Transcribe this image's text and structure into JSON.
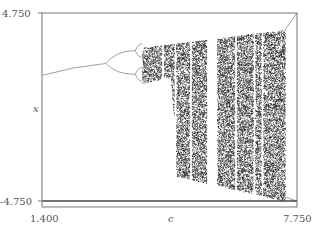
{
  "chart_data": {
    "type": "scatter",
    "title": "",
    "subtitle": "Bifurcation diagram (iterated map x -> x^2 - c style), period-doubling route to chaos",
    "xlabel": "c",
    "ylabel": "x",
    "xlim": [
      1.4,
      7.75
    ],
    "ylim": [
      -4.75,
      4.75
    ],
    "x_ticks": [
      "1.400",
      "7.750"
    ],
    "y_ticks": [
      "4.750",
      "-4.750"
    ],
    "grid": false,
    "legend": null,
    "colors": {
      "points": "#111111",
      "frame": "#777777",
      "curve": "#888888"
    },
    "features": {
      "fixed_point_branch": {
        "c_start": 1.4,
        "x_start": 1.6,
        "c_end": 2.99,
        "x_end": 2.2
      },
      "first_bifurcation_c": 2.99,
      "period2_branches": [
        {
          "c_end": 3.72,
          "x_end": 2.85
        },
        {
          "c_end": 3.72,
          "x_end": 1.65
        }
      ],
      "second_bifurcation_c": 3.72,
      "chaos_onset_c": 3.9,
      "chaos_end_c": 7.45,
      "upper_envelope": [
        [
          3.9,
          3.0
        ],
        [
          7.45,
          3.9
        ]
      ],
      "lower_envelope": [
        [
          3.9,
          1.2
        ],
        [
          4.6,
          1.5
        ],
        [
          4.7,
          -1.0
        ],
        [
          4.75,
          -3.5
        ],
        [
          7.45,
          -4.75
        ]
      ],
      "periodic_windows_c": [
        4.4,
        4.72,
        5.1,
        5.63,
        6.22,
        6.68,
        6.88
      ]
    }
  }
}
